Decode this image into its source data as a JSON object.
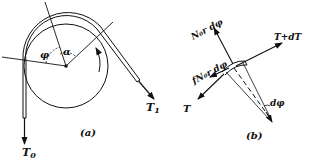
{
  "figure_a": {
    "caption": "(a)",
    "labels": {
      "tension_in": "T",
      "tension_in_sub": "0",
      "tension_out": "T",
      "tension_out_sub": "1",
      "angle_phi": "φ",
      "angle_alpha": "α"
    }
  },
  "figure_b": {
    "caption": "(b)",
    "labels": {
      "normal_force": "N₀r dφ",
      "friction_force": "fN₀r dφ",
      "tension_plus": "T+dT",
      "tension": "T",
      "dphi": "dφ"
    }
  },
  "colors": {
    "ink": "#111111",
    "background": "#ffffff"
  }
}
